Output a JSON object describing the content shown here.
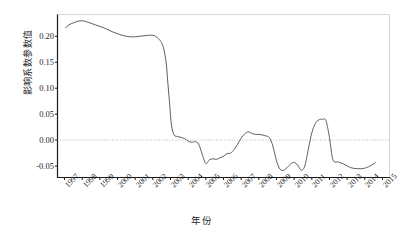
{
  "chart_data": {
    "type": "line",
    "title": "",
    "xlabel": "年份",
    "ylabel": "影响系数参数值",
    "xlim": [
      1996.6,
      2015.4
    ],
    "ylim": [
      -0.072,
      0.242
    ],
    "grid": false,
    "legend": null,
    "zero_reference_line": {
      "value": 0.0,
      "style": "dotted",
      "color": "#b9b9b9"
    },
    "yticks": [
      0.2,
      0.15,
      0.1,
      0.05,
      0.0,
      -0.05
    ],
    "ytick_labels": [
      "0.20",
      "0.15",
      "0.10",
      "0.05",
      "0.00",
      "-0.05"
    ],
    "xticks": [
      1997,
      1998,
      1999,
      2000,
      2001,
      2002,
      2003,
      2004,
      2005,
      2006,
      2007,
      2008,
      2009,
      2010,
      2011,
      2012,
      2013,
      2014,
      2015
    ],
    "xtick_labels": [
      "1997",
      "1998",
      "1999",
      "2000",
      "2001",
      "2002",
      "2003",
      "2004",
      "2005",
      "2006",
      "2007",
      "2008",
      "2009",
      "2010",
      "2011",
      "2012",
      "2013",
      "2014",
      "2015"
    ],
    "series": [
      {
        "name": "影响系数参数值",
        "color": "#4d4d4d",
        "x": [
          1997.05,
          1997.25,
          1997.5,
          1997.75,
          1998.0,
          1998.25,
          1998.5,
          1998.75,
          1999.0,
          1999.25,
          1999.5,
          1999.75,
          2000.0,
          2000.25,
          2000.5,
          2000.75,
          2001.0,
          2001.25,
          2001.5,
          2001.75,
          2002.0,
          2002.15,
          2002.3,
          2002.45,
          2002.6,
          2002.75,
          2002.85,
          2002.95,
          2003.05,
          2003.2,
          2003.4,
          2003.6,
          2003.8,
          2004.0,
          2004.2,
          2004.4,
          2004.6,
          2004.8,
          2005.0,
          2005.2,
          2005.4,
          2005.6,
          2005.8,
          2006.0,
          2006.2,
          2006.4,
          2006.6,
          2006.8,
          2007.0,
          2007.2,
          2007.4,
          2007.6,
          2007.8,
          2008.0,
          2008.2,
          2008.4,
          2008.6,
          2008.8,
          2009.0,
          2009.2,
          2009.4,
          2009.6,
          2009.8,
          2010.0,
          2010.2,
          2010.4,
          2010.6,
          2010.8,
          2011.0,
          2011.2,
          2011.4,
          2011.6,
          2011.8,
          2012.0,
          2012.2,
          2012.5,
          2012.8,
          2013.2,
          2013.6,
          2014.0,
          2014.4,
          2014.6
        ],
        "y": [
          0.216,
          0.222,
          0.226,
          0.229,
          0.23,
          0.228,
          0.225,
          0.222,
          0.219,
          0.216,
          0.212,
          0.208,
          0.205,
          0.202,
          0.2,
          0.199,
          0.199,
          0.2,
          0.201,
          0.202,
          0.202,
          0.2,
          0.196,
          0.19,
          0.178,
          0.15,
          0.11,
          0.07,
          0.03,
          0.01,
          0.007,
          0.005,
          0.003,
          -0.002,
          -0.004,
          -0.003,
          -0.008,
          -0.028,
          -0.045,
          -0.038,
          -0.036,
          -0.037,
          -0.034,
          -0.031,
          -0.026,
          -0.025,
          -0.018,
          -0.008,
          0.004,
          0.012,
          0.016,
          0.013,
          0.011,
          0.011,
          0.01,
          0.008,
          0.005,
          -0.012,
          -0.04,
          -0.056,
          -0.058,
          -0.053,
          -0.046,
          -0.043,
          -0.048,
          -0.058,
          -0.05,
          -0.018,
          0.014,
          0.032,
          0.039,
          0.04,
          0.038,
          0.005,
          -0.038,
          -0.042,
          -0.046,
          -0.053,
          -0.055,
          -0.054,
          -0.048,
          -0.043
        ]
      }
    ]
  },
  "axis": {
    "ylabel_text": "影响系数参数值",
    "xlabel_text": "年份"
  }
}
